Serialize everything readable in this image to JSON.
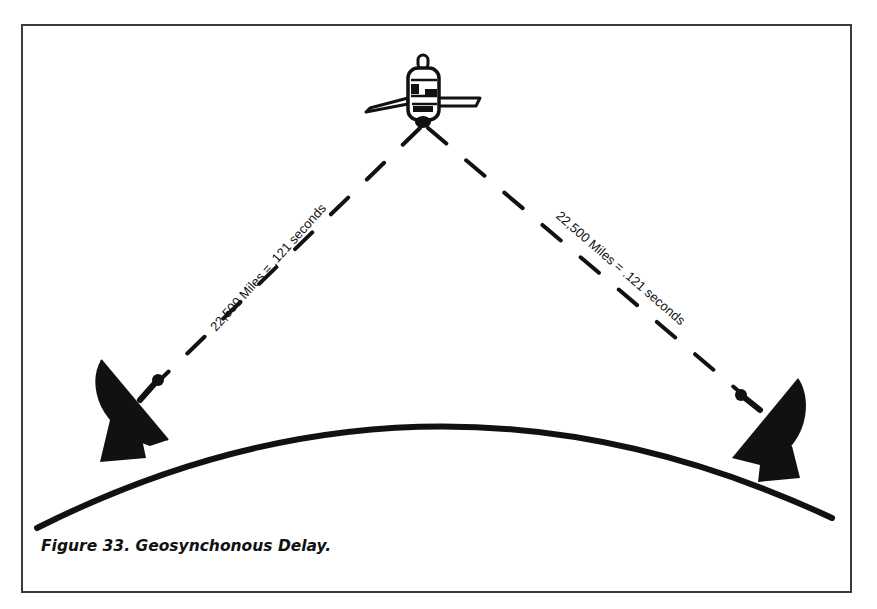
{
  "figure": {
    "caption": "Figure 33.  Geosynchonous Delay.",
    "colors": {
      "ink": "#111111",
      "frame": "#3a3a3a",
      "background": "#ffffff"
    }
  },
  "diagram": {
    "satellite": {
      "icon": "satellite-icon"
    },
    "left_dish": {
      "icon": "satellite-dish-icon"
    },
    "right_dish": {
      "icon": "satellite-dish-icon"
    },
    "earth": {
      "icon": "earth-curve"
    },
    "beams": [
      {
        "label": "22,500 Miles = .121 seconds",
        "side": "left"
      },
      {
        "label": "22,500 Miles = .121 seconds",
        "side": "right"
      }
    ]
  }
}
